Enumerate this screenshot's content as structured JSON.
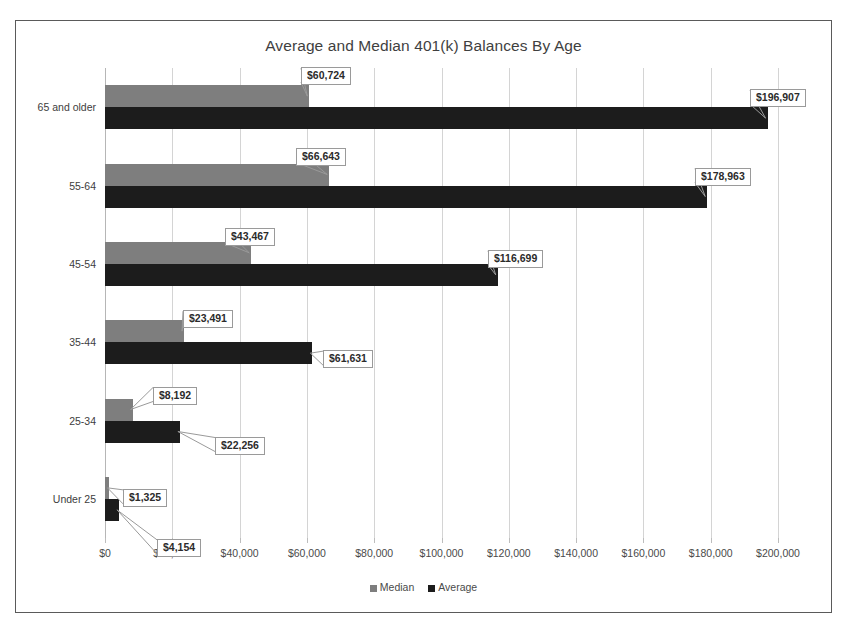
{
  "chart_data": {
    "type": "bar",
    "orientation": "horizontal",
    "title": "Average and Median 401(k) Balances By Age",
    "xlabel": "",
    "ylabel": "",
    "xlim": [
      0,
      200000
    ],
    "grid": true,
    "legend_position": "bottom",
    "categories": [
      "Under 25",
      "25-34",
      "35-44",
      "45-54",
      "55-64",
      "65 and older"
    ],
    "series": [
      {
        "name": "Median",
        "color": "#7e7e7e",
        "values": [
          1325,
          8192,
          23491,
          43467,
          66643,
          60724
        ],
        "labels": [
          "$1,325",
          "$8,192",
          "$23,491",
          "$43,467",
          "$66,643",
          "$60,724"
        ]
      },
      {
        "name": "Average",
        "color": "#1c1c1c",
        "values": [
          4154,
          22256,
          61631,
          116699,
          178963,
          196907
        ],
        "labels": [
          "$4,154",
          "$22,256",
          "$61,631",
          "$116,699",
          "$178,963",
          "$196,907"
        ]
      }
    ],
    "x_ticks": [
      0,
      20000,
      40000,
      60000,
      80000,
      100000,
      120000,
      140000,
      160000,
      180000,
      200000
    ],
    "x_tick_labels": [
      "$0",
      "$20,000",
      "$40,000",
      "$60,000",
      "$80,000",
      "$100,000",
      "$120,000",
      "$140,000",
      "$160,000",
      "$180,000",
      "$200,000"
    ]
  },
  "legend": {
    "items": [
      {
        "label": "Median",
        "color": "#7e7e7e"
      },
      {
        "label": "Average",
        "color": "#1c1c1c"
      }
    ]
  },
  "colors": {
    "median": "#7e7e7e",
    "average": "#1c1c1c",
    "gridline": "#d4d4d4",
    "frame": "#5a5a5a",
    "text": "#3b3b3b"
  }
}
